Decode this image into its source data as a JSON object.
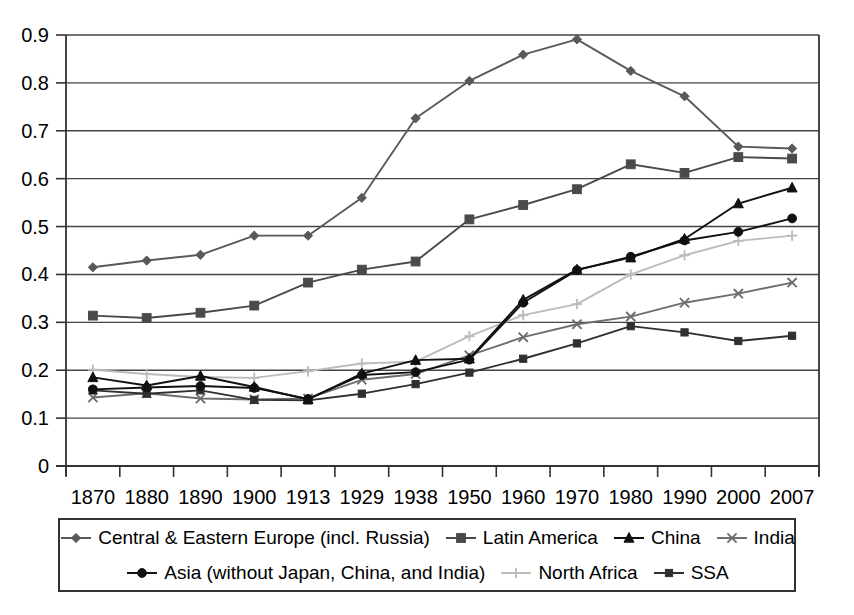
{
  "chart_data": {
    "type": "line",
    "title": "",
    "subtitle": "",
    "xlabel": "",
    "ylabel": "",
    "grid": "horizontal",
    "legend_position": "bottom",
    "ylim": [
      0,
      0.9
    ],
    "ytick_labels": [
      "0.9",
      "0.8",
      "0.7",
      "0.6",
      "0.5",
      "0.4",
      "0.3",
      "0.2",
      "0.1",
      "0"
    ],
    "ytick_values": [
      0.9,
      0.8,
      0.7,
      0.6,
      0.5,
      0.4,
      0.3,
      0.2,
      0.1,
      0
    ],
    "categories": [
      "1870",
      "1880",
      "1890",
      "1900",
      "1913",
      "1929",
      "1938",
      "1950",
      "1960",
      "1970",
      "1980",
      "1990",
      "2000",
      "2007"
    ],
    "series": [
      {
        "name": "Central & Eastern Europe (incl. Russia)",
        "marker": "diamond",
        "color": "#595959",
        "values": [
          0.415,
          0.429,
          0.441,
          0.481,
          0.481,
          0.56,
          0.726,
          0.804,
          0.859,
          0.891,
          0.825,
          0.772,
          0.667,
          0.663
        ]
      },
      {
        "name": "Latin America",
        "marker": "square",
        "color": "#4a4a4a",
        "values": [
          0.314,
          0.309,
          0.32,
          0.335,
          0.383,
          0.41,
          0.427,
          0.515,
          0.545,
          0.578,
          0.63,
          0.612,
          0.645,
          0.642
        ]
      },
      {
        "name": "China",
        "marker": "triangle",
        "color": "#111111",
        "values": [
          0.185,
          0.168,
          0.188,
          0.165,
          0.139,
          0.193,
          0.221,
          0.224,
          0.347,
          0.41,
          0.435,
          0.474,
          0.548,
          0.581
        ]
      },
      {
        "name": "India",
        "marker": "cross-x",
        "color": "#6e6e6e",
        "values": [
          0.143,
          0.152,
          0.141,
          0.139,
          0.141,
          0.18,
          0.192,
          0.231,
          0.269,
          0.296,
          0.312,
          0.341,
          0.36,
          0.383
        ]
      },
      {
        "name": "Asia (without Japan, China, and India)",
        "marker": "circle",
        "color": "#111111",
        "values": [
          0.16,
          0.164,
          0.167,
          0.163,
          0.14,
          0.19,
          0.196,
          0.222,
          0.341,
          0.409,
          0.437,
          0.471,
          0.489,
          0.517
        ]
      },
      {
        "name": "North Africa",
        "marker": "plus",
        "color": "#bcbcbc",
        "values": [
          0.201,
          0.192,
          0.186,
          0.184,
          0.198,
          0.214,
          0.218,
          0.271,
          0.315,
          0.338,
          0.4,
          0.44,
          0.47,
          0.481
        ]
      },
      {
        "name": "SSA",
        "marker": "small-square",
        "color": "#303030",
        "values": [
          0.158,
          0.151,
          0.158,
          0.138,
          0.137,
          0.151,
          0.171,
          0.195,
          0.224,
          0.256,
          0.292,
          0.279,
          0.261,
          0.272
        ]
      }
    ]
  },
  "legend": {
    "row1": [
      "Central & Eastern Europe (incl. Russia)",
      "Latin America",
      "China",
      "India"
    ],
    "row2": [
      "Asia (without Japan, China, and India)",
      "North Africa",
      "SSA"
    ]
  }
}
